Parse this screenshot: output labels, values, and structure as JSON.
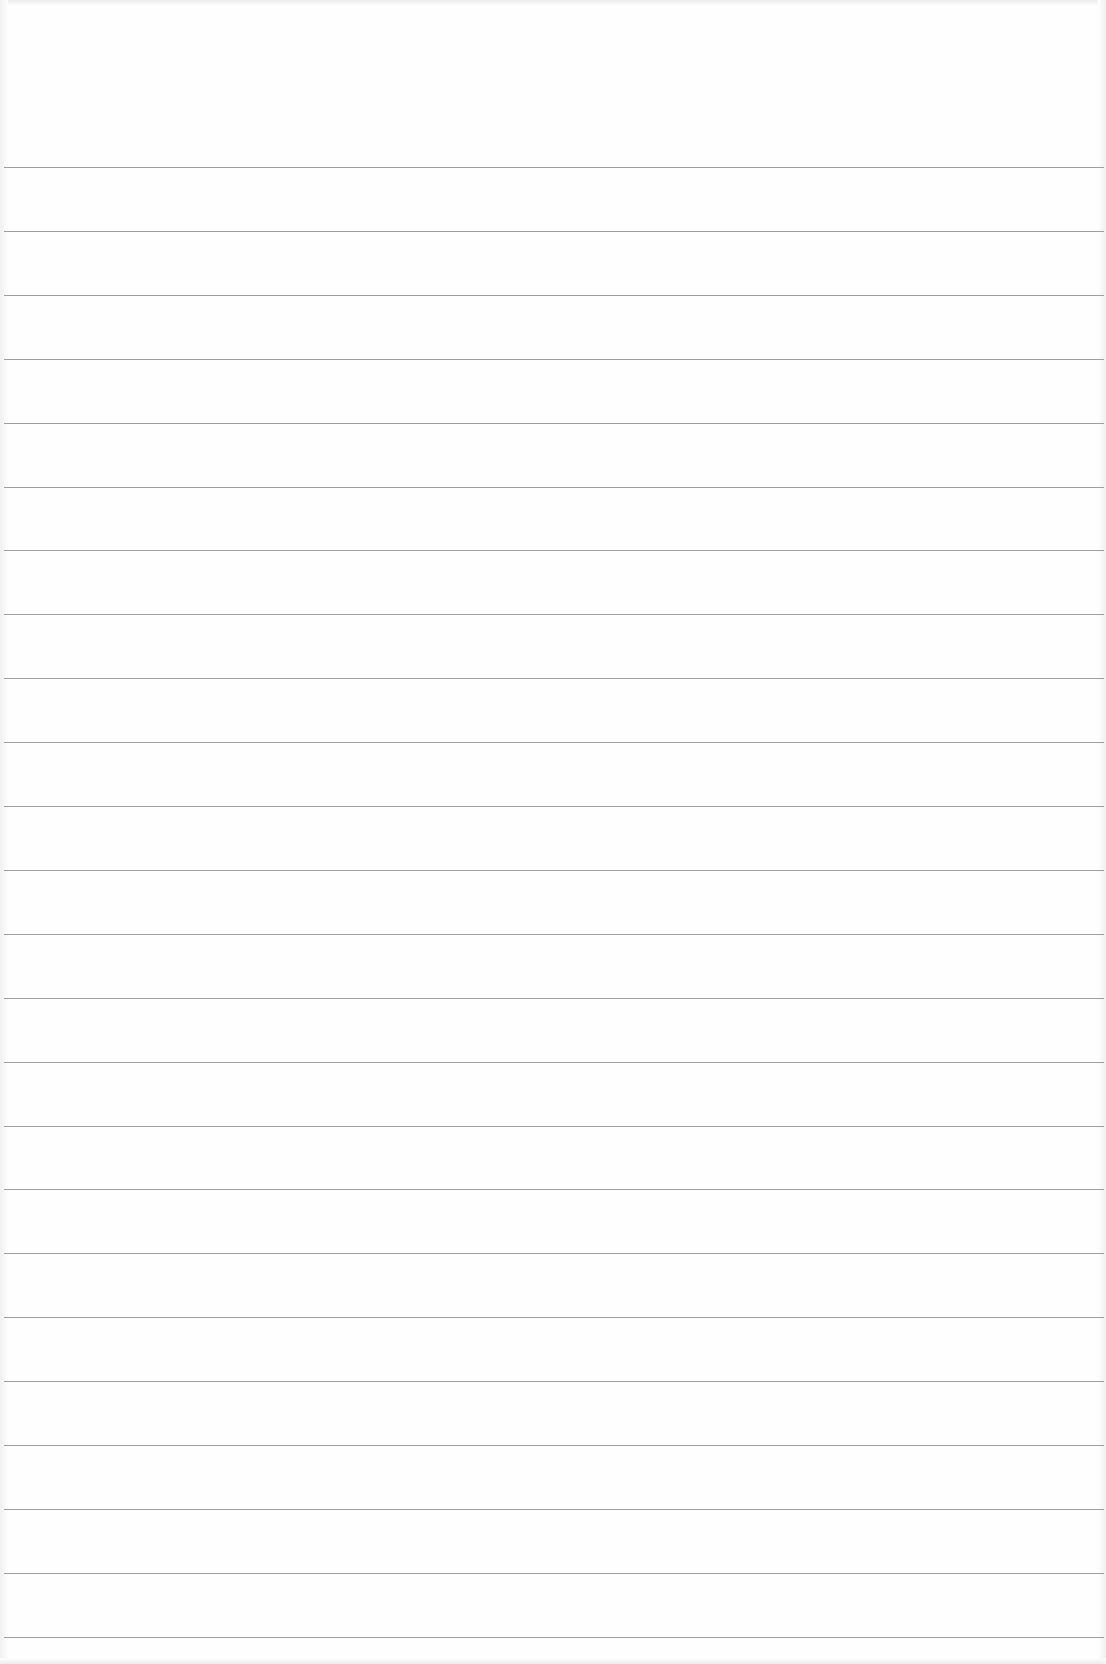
{
  "document": {
    "type": "lined-paper",
    "text_content": "",
    "background_color": "#fefefe",
    "rule_color": "#8c8c8c",
    "rules": {
      "count": 24,
      "first_y": 167,
      "spacing": 63.9,
      "left": 4,
      "width": 1100
    }
  }
}
